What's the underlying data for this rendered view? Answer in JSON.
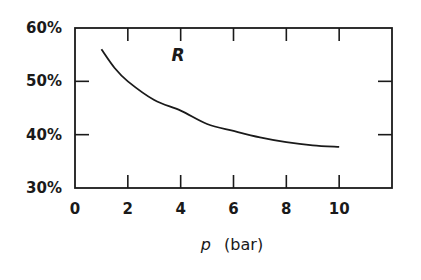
{
  "chart_data": {
    "type": "line",
    "title": "",
    "xlabel": "p (bar)",
    "xlabel_var": "p",
    "xlabel_unit": "(bar)",
    "ylabel": "",
    "xlim": [
      0,
      12
    ],
    "ylim": [
      30,
      60
    ],
    "xticks": [
      0,
      2,
      4,
      6,
      8,
      10
    ],
    "xtick_labels": [
      "0",
      "2",
      "4",
      "6",
      "8",
      "10"
    ],
    "yticks": [
      30,
      40,
      50,
      60
    ],
    "ytick_labels": [
      "30%",
      "40%",
      "50%",
      "60%"
    ],
    "grid": false,
    "legend": null,
    "annotations": [
      {
        "text": "R",
        "x": 3.9,
        "y": 55
      }
    ],
    "series": [
      {
        "name": "R",
        "x": [
          1.0,
          1.5,
          2.0,
          3.0,
          4.0,
          5.0,
          6.0,
          7.0,
          8.0,
          9.0,
          10.0
        ],
        "values": [
          56.0,
          52.5,
          50.0,
          46.5,
          44.5,
          42.0,
          40.7,
          39.5,
          38.6,
          38.0,
          37.7
        ]
      }
    ]
  }
}
